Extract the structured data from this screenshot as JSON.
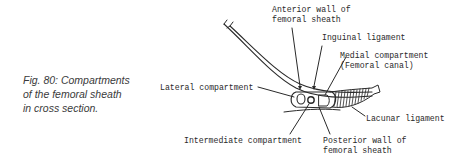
{
  "caption": {
    "line1": "Fig. 80: Compartments",
    "line2": "of  the  femoral sheath",
    "line3": "in  cross  section."
  },
  "labels": {
    "anterior_wall": [
      "Anterior wall of",
      "femoral sheath"
    ],
    "inguinal_ligament": "Inguinal ligament",
    "medial_compartment": [
      "Medial compartment",
      "(Femoral canal)"
    ],
    "lateral_compartment": "Lateral compartment",
    "lacunar_ligament": "Lacunar ligament",
    "intermediate_compartment": "Intermediate compartment",
    "posterior_wall": [
      "Posterior wall of",
      "femoral sheath"
    ]
  },
  "colors": {
    "ink": "#2a2a2a",
    "caption": "#3a3a3a",
    "background": "#ffffff"
  }
}
